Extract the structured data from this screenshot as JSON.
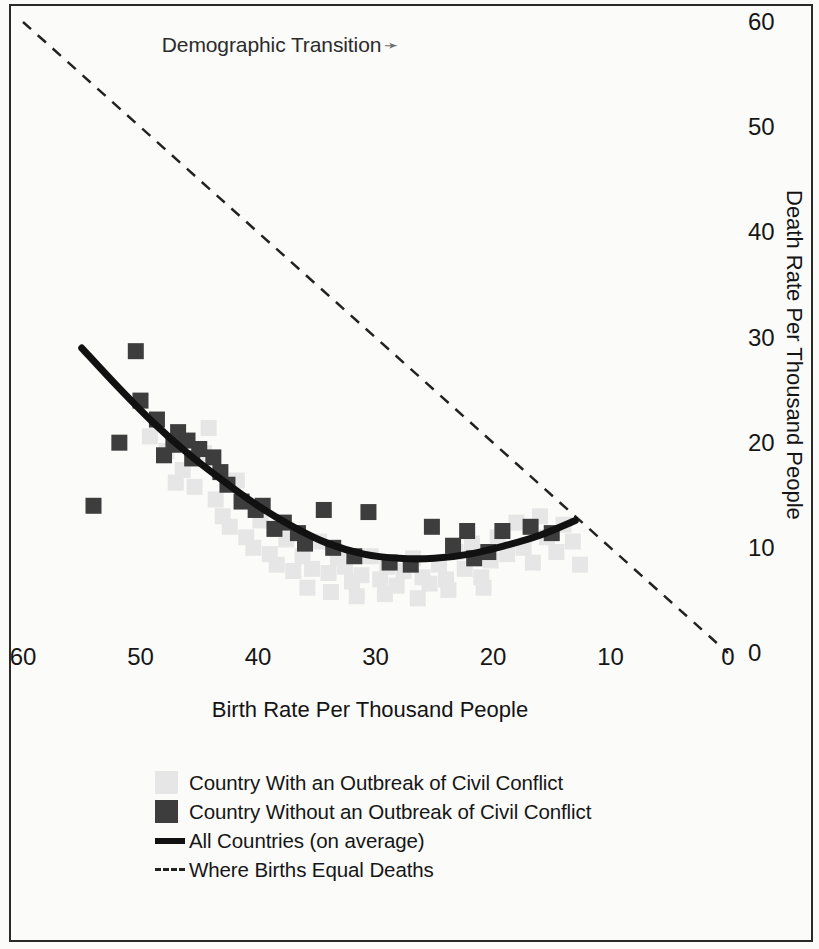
{
  "chart_data": {
    "type": "scatter",
    "title": "Demographic Transition",
    "title_arrow": "➛",
    "xlabel": "Birth Rate Per Thousand People",
    "ylabel": "Death Rate Per Thousand People",
    "xlim": [
      60,
      0
    ],
    "ylim": [
      0,
      60
    ],
    "x_ticks": [
      60,
      50,
      40,
      30,
      20,
      10,
      0
    ],
    "y_ticks": [
      0,
      10,
      20,
      30,
      40,
      50,
      60
    ],
    "x_axis_reversed": true,
    "grid": false,
    "legend_position": "below-plot-left",
    "colors": {
      "with_conflict": "#e6e6e6",
      "without_conflict": "#3d3d3d",
      "average_line": "#111111",
      "equal_line": "#222222",
      "text": "#161616",
      "frame": "#2a2a2a",
      "background": "#fbfbfa"
    },
    "legend": [
      {
        "key": "swatch-light",
        "label": "Country With an Outbreak of Civil Conflict"
      },
      {
        "key": "swatch-dark",
        "label": "Country Without an Outbreak of Civil Conflict"
      },
      {
        "key": "line-solid",
        "label": "All Countries (on average)"
      },
      {
        "key": "line-dashed",
        "label": "Where Births Equal Deaths"
      }
    ],
    "series": [
      {
        "name": "Country Without an Outbreak of Civil Conflict",
        "marker": "square",
        "color": "#3d3d3d",
        "points": [
          [
            54.0,
            14.0
          ],
          [
            51.8,
            20.0
          ],
          [
            50.4,
            28.7
          ],
          [
            50.0,
            24.0
          ],
          [
            48.6,
            22.2
          ],
          [
            48.0,
            18.8
          ],
          [
            47.2,
            19.8
          ],
          [
            46.8,
            21.0
          ],
          [
            46.0,
            20.2
          ],
          [
            45.6,
            18.5
          ],
          [
            45.0,
            19.4
          ],
          [
            43.8,
            18.6
          ],
          [
            43.2,
            17.2
          ],
          [
            42.6,
            16.0
          ],
          [
            41.4,
            14.4
          ],
          [
            40.2,
            13.6
          ],
          [
            39.6,
            14.0
          ],
          [
            38.6,
            11.8
          ],
          [
            37.8,
            12.4
          ],
          [
            36.6,
            11.4
          ],
          [
            36.0,
            10.4
          ],
          [
            34.4,
            13.6
          ],
          [
            33.6,
            10.0
          ],
          [
            31.8,
            9.2
          ],
          [
            30.6,
            13.4
          ],
          [
            28.8,
            8.6
          ],
          [
            27.0,
            8.4
          ],
          [
            25.2,
            12.0
          ],
          [
            23.4,
            10.2
          ],
          [
            22.2,
            11.6
          ],
          [
            21.6,
            9.0
          ],
          [
            20.4,
            9.6
          ],
          [
            19.2,
            11.6
          ],
          [
            16.8,
            12.0
          ],
          [
            15.0,
            11.4
          ]
        ]
      },
      {
        "name": "Country With an Outbreak of Civil Conflict",
        "marker": "square",
        "color": "#e6e6e6",
        "points": [
          [
            49.2,
            20.6
          ],
          [
            47.8,
            19.2
          ],
          [
            46.4,
            17.4
          ],
          [
            45.4,
            15.8
          ],
          [
            44.6,
            19.0
          ],
          [
            43.6,
            14.6
          ],
          [
            43.0,
            13.0
          ],
          [
            42.4,
            12.0
          ],
          [
            41.8,
            16.4
          ],
          [
            41.0,
            11.0
          ],
          [
            40.4,
            10.0
          ],
          [
            39.8,
            12.6
          ],
          [
            39.0,
            9.4
          ],
          [
            38.4,
            8.4
          ],
          [
            37.6,
            10.8
          ],
          [
            37.0,
            7.8
          ],
          [
            36.2,
            9.2
          ],
          [
            35.4,
            8.0
          ],
          [
            34.8,
            10.6
          ],
          [
            34.0,
            7.6
          ],
          [
            33.2,
            9.0
          ],
          [
            32.6,
            8.2
          ],
          [
            32.0,
            6.8
          ],
          [
            31.2,
            7.4
          ],
          [
            30.4,
            9.2
          ],
          [
            29.6,
            7.0
          ],
          [
            29.0,
            8.2
          ],
          [
            28.2,
            6.4
          ],
          [
            27.6,
            7.8
          ],
          [
            26.8,
            9.0
          ],
          [
            26.0,
            7.2
          ],
          [
            25.4,
            6.6
          ],
          [
            24.6,
            8.4
          ],
          [
            24.0,
            7.0
          ],
          [
            23.2,
            9.6
          ],
          [
            22.4,
            8.0
          ],
          [
            21.8,
            10.4
          ],
          [
            21.0,
            7.2
          ],
          [
            20.2,
            8.8
          ],
          [
            19.6,
            11.0
          ],
          [
            18.8,
            9.4
          ],
          [
            18.0,
            12.4
          ],
          [
            17.4,
            10.0
          ],
          [
            16.6,
            8.6
          ],
          [
            16.0,
            13.0
          ],
          [
            15.4,
            11.0
          ],
          [
            14.6,
            9.6
          ],
          [
            14.0,
            12.2
          ],
          [
            13.2,
            10.6
          ],
          [
            12.6,
            8.4
          ],
          [
            44.2,
            21.4
          ],
          [
            47.0,
            16.2
          ],
          [
            35.8,
            6.2
          ],
          [
            33.8,
            5.8
          ],
          [
            31.6,
            5.4
          ],
          [
            29.2,
            5.6
          ],
          [
            26.4,
            5.2
          ],
          [
            23.8,
            6.0
          ],
          [
            20.8,
            6.2
          ]
        ]
      }
    ],
    "curves": [
      {
        "name": "All Countries (on average)",
        "style": "solid",
        "color": "#111111",
        "width": 7,
        "points": [
          [
            55.0,
            29.0
          ],
          [
            52.0,
            25.4
          ],
          [
            49.0,
            22.0
          ],
          [
            46.0,
            19.0
          ],
          [
            43.0,
            16.4
          ],
          [
            40.0,
            14.0
          ],
          [
            37.0,
            12.0
          ],
          [
            34.0,
            10.4
          ],
          [
            31.0,
            9.4
          ],
          [
            28.0,
            9.0
          ],
          [
            25.0,
            9.0
          ],
          [
            22.0,
            9.4
          ],
          [
            19.0,
            10.2
          ],
          [
            16.0,
            11.2
          ],
          [
            13.0,
            12.6
          ]
        ]
      },
      {
        "name": "Where Births Equal Deaths",
        "style": "dashed",
        "color": "#222222",
        "width": 2.5,
        "points": [
          [
            60.0,
            60.0
          ],
          [
            0.0,
            0.0
          ]
        ]
      }
    ]
  }
}
